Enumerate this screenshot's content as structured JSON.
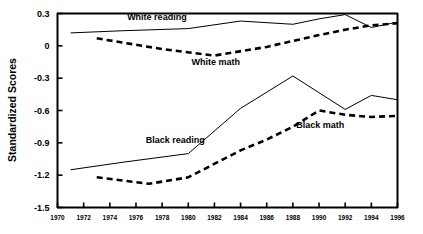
{
  "chart_data": {
    "type": "line",
    "title": "",
    "xlabel": "",
    "ylabel": "Standardized Scores",
    "xlim": [
      1970,
      1996
    ],
    "ylim": [
      -1.5,
      0.3
    ],
    "grid": false,
    "legend_position": "inline-annotations",
    "x_ticks": [
      1970,
      1972,
      1974,
      1976,
      1978,
      1980,
      1982,
      1984,
      1986,
      1988,
      1990,
      1992,
      1994,
      1996
    ],
    "y_ticks": [
      0.3,
      0,
      -0.3,
      -0.6,
      -0.9,
      -1.2,
      -1.5
    ],
    "y_tick_labels": [
      "0.3",
      "0",
      "-0.3",
      "-0.6",
      "-0.9",
      "-1.2",
      "-1.5"
    ],
    "x_tick_labels": [
      "1970",
      "1972",
      "1974",
      "1976",
      "1978",
      "1980",
      "1982",
      "1984",
      "1986",
      "1988",
      "1990",
      "1992",
      "1994",
      "1996"
    ],
    "series": [
      {
        "name": "White reading",
        "style": "solid",
        "color": "#000000",
        "label_x": 1977.6,
        "label_y": 0.265,
        "x": [
          1971,
          1975,
          1980,
          1984,
          1988,
          1990,
          1992,
          1994,
          1996
        ],
        "values": [
          0.12,
          0.14,
          0.16,
          0.23,
          0.2,
          0.25,
          0.29,
          0.17,
          0.22
        ]
      },
      {
        "name": "White math",
        "style": "dashed",
        "color": "#000000",
        "label_x": 1982.1,
        "label_y": -0.145,
        "x": [
          1973,
          1978,
          1982,
          1986,
          1990,
          1992,
          1994,
          1996
        ],
        "values": [
          0.07,
          -0.03,
          -0.09,
          -0.01,
          0.1,
          0.15,
          0.19,
          0.21
        ]
      },
      {
        "name": "Black reading",
        "style": "solid",
        "color": "#000000",
        "label_x": 1979.0,
        "label_y": -0.875,
        "x": [
          1971,
          1975,
          1980,
          1984,
          1988,
          1992,
          1994,
          1996
        ],
        "values": [
          -1.15,
          -1.08,
          -1.0,
          -0.58,
          -0.28,
          -0.59,
          -0.46,
          -0.5
        ]
      },
      {
        "name": "Black math",
        "style": "dashed",
        "color": "#000000",
        "label_x": 1990.1,
        "label_y": -0.735,
        "x": [
          1973,
          1977,
          1980,
          1984,
          1986,
          1988,
          1990,
          1992,
          1994,
          1996
        ],
        "values": [
          -1.22,
          -1.28,
          -1.22,
          -0.97,
          -0.87,
          -0.75,
          -0.6,
          -0.64,
          -0.66,
          -0.65
        ]
      }
    ]
  }
}
